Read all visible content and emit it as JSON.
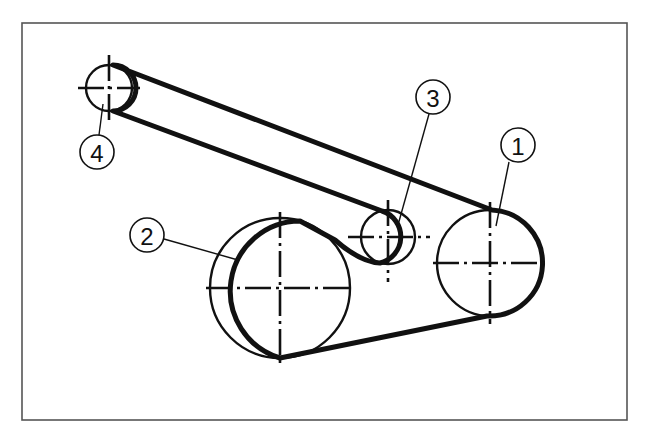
{
  "diagram": {
    "colors": {
      "line": "#111111",
      "frame": "#555555",
      "background": "#ffffff"
    },
    "pulleys": [
      {
        "id": "1",
        "label": "1",
        "cx": 490,
        "cy": 263,
        "r": 53
      },
      {
        "id": "2",
        "label": "2",
        "cx": 280,
        "cy": 288,
        "r": 70
      },
      {
        "id": "3",
        "label": "3",
        "cx": 388,
        "cy": 237,
        "r": 27
      },
      {
        "id": "4",
        "label": "4",
        "cx": 109,
        "cy": 88,
        "r": 23
      }
    ],
    "callouts": [
      {
        "label": "1",
        "cx": 518,
        "cy": 145,
        "r": 17,
        "leader": [
          509,
          162,
          496,
          226
        ]
      },
      {
        "label": "2",
        "cx": 147,
        "cy": 235,
        "r": 17,
        "leader": [
          164,
          239,
          238,
          260
        ]
      },
      {
        "label": "3",
        "cx": 433,
        "cy": 97,
        "r": 17,
        "leader": [
          429,
          114,
          398,
          225
        ]
      },
      {
        "label": "4",
        "cx": 97,
        "cy": 152,
        "r": 17,
        "leader": [
          99,
          135,
          103,
          104
        ]
      }
    ]
  }
}
